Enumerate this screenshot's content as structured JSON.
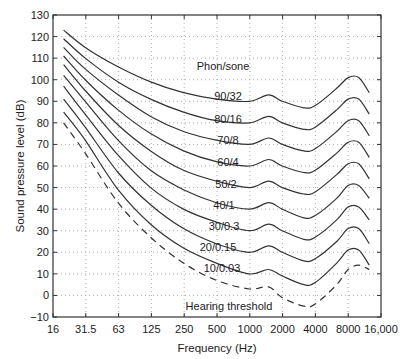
{
  "chart_data": {
    "type": "line",
    "title": "",
    "xlabel": "Frequency (Hz)",
    "ylabel": "Sound pressure level (dB)",
    "xscale": "log2",
    "xlim": [
      16,
      16000
    ],
    "ylim": [
      -10,
      130
    ],
    "grid": true,
    "x_ticks": [
      "16",
      "31.5",
      "63",
      "125",
      "250",
      "500",
      "1000",
      "2000",
      "4000",
      "8000",
      "16,000"
    ],
    "y_ticks": [
      "-10",
      "0",
      "10",
      "20",
      "30",
      "40",
      "50",
      "60",
      "70",
      "80",
      "90",
      "100",
      "110",
      "120",
      "130"
    ],
    "legend_title": "Phon/sone",
    "x": [
      20,
      31.5,
      63,
      125,
      250,
      500,
      1000,
      1500,
      2000,
      3150,
      4000,
      6300,
      8000,
      10000,
      12500
    ],
    "series": [
      {
        "name": "90/32",
        "style": "solid",
        "values": [
          123,
          115,
          106,
          99,
          94,
          91,
          90,
          93,
          90,
          87,
          88,
          96,
          101,
          101,
          94
        ]
      },
      {
        "name": "80/16",
        "style": "solid",
        "values": [
          119,
          110,
          99,
          91,
          85,
          81,
          80,
          83,
          80,
          77,
          78,
          86,
          91,
          91,
          84
        ]
      },
      {
        "name": "70/8",
        "style": "solid",
        "values": [
          115,
          105,
          93,
          83,
          76,
          72,
          70,
          73,
          70,
          67,
          68,
          76,
          81,
          81,
          74
        ]
      },
      {
        "name": "60/4",
        "style": "solid",
        "values": [
          111,
          100,
          86,
          75,
          67,
          62,
          60,
          63,
          60,
          57,
          58,
          66,
          71,
          71,
          64
        ]
      },
      {
        "name": "50/2",
        "style": "solid",
        "values": [
          107,
          95,
          79,
          67,
          58,
          53,
          50,
          53,
          50,
          47,
          48,
          56,
          61,
          61,
          54
        ]
      },
      {
        "name": "40/1",
        "style": "solid",
        "values": [
          102,
          90,
          72,
          58,
          49,
          43,
          40,
          43,
          40,
          36,
          37,
          45,
          51,
          51,
          45
        ]
      },
      {
        "name": "30/0.3",
        "style": "solid",
        "values": [
          97,
          84,
          65,
          50,
          40,
          34,
          30,
          33,
          30,
          26,
          27,
          35,
          41,
          41,
          35
        ]
      },
      {
        "name": "20/0.15",
        "style": "solid",
        "values": [
          91,
          78,
          57,
          42,
          31,
          24,
          20,
          23,
          20,
          16,
          17,
          25,
          31,
          31,
          24
        ]
      },
      {
        "name": "10/0.03",
        "style": "solid",
        "values": [
          85,
          72,
          49,
          33,
          22,
          15,
          10,
          12,
          9,
          5,
          6,
          15,
          21,
          21,
          14
        ]
      },
      {
        "name": "Hearing threshold",
        "style": "dashed",
        "values": [
          80,
          66,
          43,
          27,
          15,
          7,
          3,
          4,
          -1,
          -5,
          -4,
          5,
          12,
          14,
          12
        ]
      }
    ],
    "annotations": [
      "Phon/sone",
      "90/32",
      "80/16",
      "70/8",
      "60/4",
      "50/2",
      "40/1",
      "30/0.3",
      "20/0.15",
      "10/0.03",
      "Hearing threshold"
    ]
  }
}
